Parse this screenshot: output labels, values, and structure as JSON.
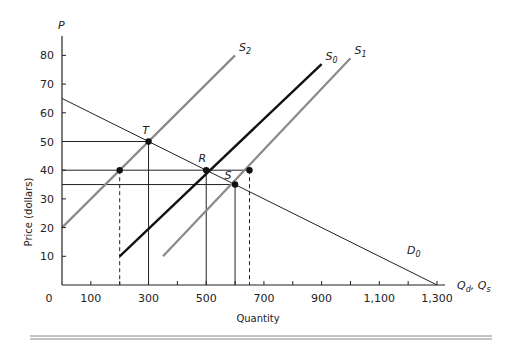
{
  "chart_data": {
    "type": "line",
    "title": "",
    "xlabel": "Quantity",
    "ylabel": "Price (dollars)",
    "x_axis_symbol": "Qd, Qs",
    "y_axis_symbol": "P",
    "xlim": [
      0,
      1300
    ],
    "ylim": [
      0,
      85
    ],
    "x_ticks": [
      0,
      100,
      300,
      500,
      700,
      900,
      1100,
      1300
    ],
    "x_tick_labels": [
      "0",
      "100",
      "300",
      "500",
      "700",
      "900",
      "1,100",
      "1,300"
    ],
    "x_minor_ticks": [
      200,
      400,
      600,
      800,
      1000,
      1200
    ],
    "y_ticks": [
      10,
      20,
      30,
      40,
      50,
      60,
      70,
      80
    ],
    "y_tick_labels": [
      "10",
      "20",
      "30",
      "40",
      "50",
      "60",
      "70",
      "80"
    ],
    "grid": false,
    "series": [
      {
        "name": "D0",
        "label_main": "D",
        "label_sub": "0",
        "style": "thin-black",
        "points": [
          [
            0,
            65
          ],
          [
            1300,
            0
          ]
        ]
      },
      {
        "name": "S0",
        "label_main": "S",
        "label_sub": "0",
        "style": "thick-black",
        "points": [
          [
            200,
            10
          ],
          [
            900,
            77
          ]
        ]
      },
      {
        "name": "S1",
        "label_main": "S",
        "label_sub": "1",
        "style": "gray",
        "points": [
          [
            350,
            10
          ],
          [
            1000,
            79
          ]
        ]
      },
      {
        "name": "S2",
        "label_main": "S",
        "label_sub": "2",
        "style": "gray",
        "points": [
          [
            0,
            20
          ],
          [
            600,
            80
          ]
        ]
      }
    ],
    "labeled_points": [
      {
        "label": "T",
        "q": 300,
        "p": 50
      },
      {
        "label": "R",
        "q": 500,
        "p": 40
      },
      {
        "label": "S",
        "q": 600,
        "p": 35
      }
    ],
    "unlabeled_points": [
      {
        "q": 200,
        "p": 40
      },
      {
        "q": 650,
        "p": 40
      }
    ],
    "guide_lines": {
      "horizontal_prices": [
        50,
        40,
        35
      ],
      "solid_vertical_quantities": [
        300,
        500,
        600
      ],
      "dashed_vertical_quantities": [
        200,
        650
      ]
    }
  }
}
